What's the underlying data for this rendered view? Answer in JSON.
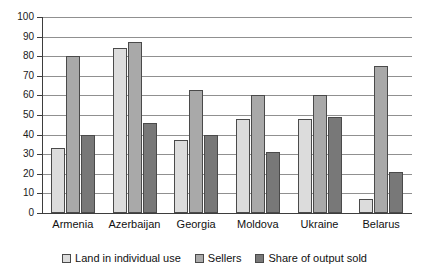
{
  "chart_data": {
    "type": "bar",
    "title": "",
    "subtitle": "",
    "xlabel": "",
    "ylabel": "",
    "ylim": [
      0,
      100
    ],
    "ytick_step": 10,
    "yticks": [
      100,
      90,
      80,
      70,
      60,
      50,
      40,
      30,
      20,
      10,
      0
    ],
    "grid": true,
    "legend_position": "bottom",
    "categories": [
      "Armenia",
      "Azerbaijan",
      "Georgia",
      "Moldova",
      "Ukraine",
      "Belarus"
    ],
    "series": [
      {
        "name": "Land in individual use",
        "color": "#dcdcdc",
        "values": [
          33,
          84,
          37,
          48,
          48,
          7
        ]
      },
      {
        "name": "Sellers",
        "color": "#a9a9a9",
        "values": [
          80,
          87,
          63,
          60,
          60,
          75
        ]
      },
      {
        "name": "Share of output sold",
        "color": "#787878",
        "values": [
          40,
          46,
          40,
          31,
          49,
          21
        ]
      }
    ]
  },
  "colors": {
    "series_light": "#dcdcdc",
    "series_medium": "#a9a9a9",
    "series_dark": "#787878",
    "gridline": "#909090",
    "axis": "#3d3d3d",
    "text": "#111111",
    "background": "#ffffff"
  }
}
